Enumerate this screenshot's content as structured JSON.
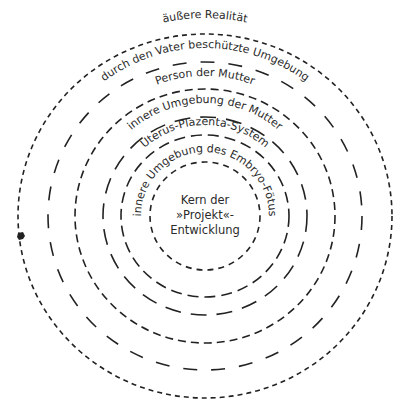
{
  "diagram": {
    "center": {
      "x": 205,
      "y": 216
    },
    "rings": [
      {
        "id": "ring-1",
        "rx": 187,
        "ry": 182,
        "dash": "5 4"
      },
      {
        "id": "ring-2",
        "rx": 157,
        "ry": 154,
        "dash": "14 14"
      },
      {
        "id": "ring-3",
        "rx": 130,
        "ry": 127,
        "dash": "8 5"
      },
      {
        "id": "ring-4",
        "rx": 102,
        "ry": 99,
        "dash": "16 10"
      },
      {
        "id": "ring-5",
        "rx": 84,
        "ry": 81,
        "dash": "11 6"
      },
      {
        "id": "ring-6",
        "rx": 55,
        "ry": 54,
        "dash": "6 5"
      }
    ],
    "labels": [
      {
        "id": "label-aeussere-realitaet",
        "text": "äußere Realität",
        "r": 198,
        "size": 11
      },
      {
        "id": "label-vater",
        "text": "durch den Vater beschützte Umgebung",
        "r": 168,
        "size": 11
      },
      {
        "id": "label-person-mutter",
        "text": "Person der Mutter",
        "r": 140,
        "size": 11
      },
      {
        "id": "label-innere-mutter",
        "text": "innere Umgebung der Mutter",
        "r": 113,
        "size": 11
      },
      {
        "id": "label-uterus",
        "text": "Uterus-Plazenta-System",
        "r": 91,
        "size": 11
      },
      {
        "id": "label-embryo",
        "text": "innere Umgebung des Embryo-Fötus",
        "r": 64,
        "size": 11
      }
    ],
    "center_text": {
      "line1": "Kern der",
      "line2": "»Projekt«-",
      "line3": "Entwicklung"
    },
    "artifact": {
      "x": 21,
      "y": 236
    }
  }
}
